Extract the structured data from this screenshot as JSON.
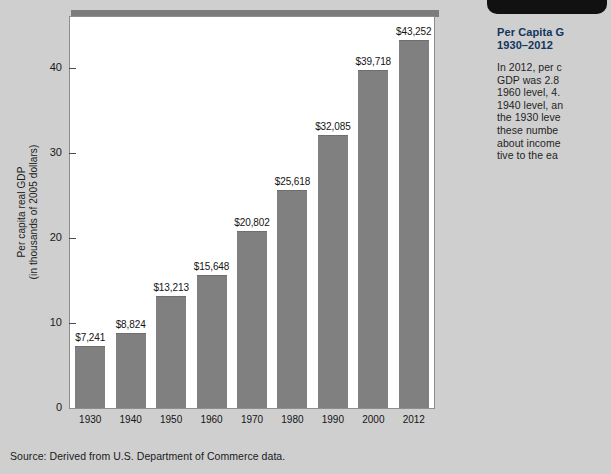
{
  "figure": {
    "source_note": "Source: Derived from U.S. Department of Commerce data.",
    "bar_color": "#808080",
    "frame_color": "#8e8e8e",
    "page_background": "#cfcfcf"
  },
  "sidebar": {
    "title_line1": "Per Capita G",
    "title_line2": "1930–2012",
    "title_color": "#13355e",
    "body_lines": [
      "In 2012, per c",
      "GDP was 2.8",
      "1960 level, 4.",
      "1940 level, an",
      "the 1930 leve",
      "these numbe",
      "about income",
      "tive to the ea"
    ]
  },
  "chart_data": {
    "type": "bar",
    "title": "",
    "xlabel": "",
    "ylabel": "Per capita real GDP\n(in thousands of 2005 dollars)",
    "ylabel_line1": "Per capita real GDP",
    "ylabel_line2": "(in thousands of 2005 dollars)",
    "categories": [
      "1930",
      "1940",
      "1950",
      "1960",
      "1970",
      "1980",
      "1990",
      "2000",
      "2012"
    ],
    "values": [
      7.241,
      8.824,
      13.213,
      15.648,
      20.802,
      25.618,
      32.085,
      39.718,
      43.252
    ],
    "data_labels": [
      "$7,241",
      "$8,824",
      "$13,213",
      "$15,648",
      "$20,802",
      "$25,618",
      "$32,085",
      "$39,718",
      "$43,252"
    ],
    "ylim": [
      0,
      46
    ],
    "yticks": [
      0,
      10,
      20,
      30,
      40
    ],
    "ytick_labels": [
      "0",
      "10",
      "20",
      "30",
      "40"
    ],
    "grid": false,
    "legend": false
  }
}
